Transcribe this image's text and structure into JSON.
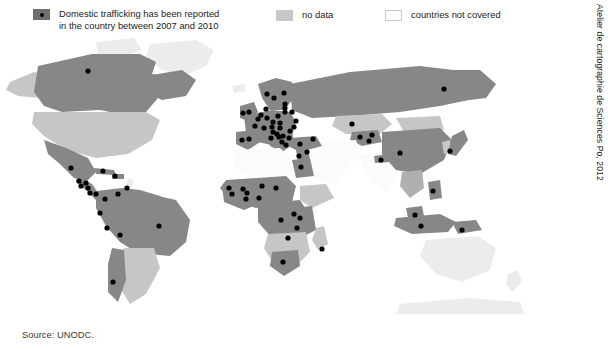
{
  "figure": {
    "source_text": "Source: UNODC.",
    "credit_text": "Atelier de cartographie de Sciences Po, 2012",
    "background": "#ffffff"
  },
  "legend": {
    "items": [
      {
        "key": "reported",
        "label": "Domestic trafficking has been reported\nin the country between 2007 and 2010",
        "swatch_type": "dotted-square",
        "swatch_color": "#6f6f6f",
        "dot_color": "#000000"
      },
      {
        "key": "no_data",
        "label": "no data",
        "swatch_type": "filled-square",
        "swatch_color": "#c7c7c7"
      },
      {
        "key": "not_covered",
        "label": "countries not covered",
        "swatch_type": "outlined-square",
        "swatch_color": "#ffffff"
      }
    ]
  },
  "map": {
    "projection": "world",
    "colors": {
      "reported": "#878787",
      "no_data": "#c6c6c6",
      "not_covered": "#fbfbfb",
      "faint": "#ececec",
      "mid": "#b0b0b0",
      "dot": "#000000",
      "border": "#ffffff"
    },
    "dot_radius": 2.6,
    "dots": [
      {
        "name": "canada",
        "x": 88,
        "y": 35
      },
      {
        "name": "mexico",
        "x": 71,
        "y": 132
      },
      {
        "name": "guatemala",
        "x": 79,
        "y": 145
      },
      {
        "name": "el-salvador",
        "x": 81,
        "y": 150
      },
      {
        "name": "honduras",
        "x": 86,
        "y": 147
      },
      {
        "name": "nicaragua",
        "x": 88,
        "y": 152
      },
      {
        "name": "costa-rica",
        "x": 90,
        "y": 157
      },
      {
        "name": "panama",
        "x": 96,
        "y": 158
      },
      {
        "name": "cuba",
        "x": 103,
        "y": 135
      },
      {
        "name": "dominican-republic",
        "x": 115,
        "y": 140
      },
      {
        "name": "trinidad",
        "x": 127,
        "y": 152
      },
      {
        "name": "colombia",
        "x": 105,
        "y": 163
      },
      {
        "name": "venezuela",
        "x": 118,
        "y": 158
      },
      {
        "name": "ecuador",
        "x": 100,
        "y": 177
      },
      {
        "name": "peru",
        "x": 107,
        "y": 192
      },
      {
        "name": "bolivia",
        "x": 120,
        "y": 199
      },
      {
        "name": "brazil",
        "x": 159,
        "y": 190
      },
      {
        "name": "chile",
        "x": 113,
        "y": 246
      },
      {
        "name": "uk",
        "x": 249,
        "y": 76
      },
      {
        "name": "ireland",
        "x": 243,
        "y": 77
      },
      {
        "name": "norway",
        "x": 267,
        "y": 58
      },
      {
        "name": "sweden",
        "x": 274,
        "y": 62
      },
      {
        "name": "finland",
        "x": 284,
        "y": 57
      },
      {
        "name": "estonia",
        "x": 285,
        "y": 68
      },
      {
        "name": "latvia",
        "x": 285,
        "y": 72
      },
      {
        "name": "lithuania",
        "x": 285,
        "y": 76
      },
      {
        "name": "belarus",
        "x": 292,
        "y": 76
      },
      {
        "name": "denmark",
        "x": 266,
        "y": 73
      },
      {
        "name": "netherlands",
        "x": 261,
        "y": 79
      },
      {
        "name": "belgium",
        "x": 258,
        "y": 83
      },
      {
        "name": "germany",
        "x": 267,
        "y": 82
      },
      {
        "name": "poland",
        "x": 278,
        "y": 80
      },
      {
        "name": "czech",
        "x": 273,
        "y": 86
      },
      {
        "name": "slovakia",
        "x": 280,
        "y": 87
      },
      {
        "name": "ukraine",
        "x": 296,
        "y": 85
      },
      {
        "name": "moldova",
        "x": 294,
        "y": 91
      },
      {
        "name": "austria",
        "x": 272,
        "y": 91
      },
      {
        "name": "hungary",
        "x": 280,
        "y": 92
      },
      {
        "name": "romania",
        "x": 290,
        "y": 95
      },
      {
        "name": "switzerland",
        "x": 264,
        "y": 92
      },
      {
        "name": "france",
        "x": 255,
        "y": 90
      },
      {
        "name": "slovenia",
        "x": 273,
        "y": 96
      },
      {
        "name": "croatia",
        "x": 277,
        "y": 98
      },
      {
        "name": "bosnia",
        "x": 279,
        "y": 101
      },
      {
        "name": "serbia",
        "x": 283,
        "y": 100
      },
      {
        "name": "bulgaria",
        "x": 289,
        "y": 102
      },
      {
        "name": "italy",
        "x": 271,
        "y": 102
      },
      {
        "name": "albania",
        "x": 282,
        "y": 106
      },
      {
        "name": "greece",
        "x": 286,
        "y": 109
      },
      {
        "name": "spain",
        "x": 249,
        "y": 103
      },
      {
        "name": "portugal",
        "x": 242,
        "y": 104
      },
      {
        "name": "turkey",
        "x": 300,
        "y": 108
      },
      {
        "name": "georgia",
        "x": 313,
        "y": 103
      },
      {
        "name": "russia-far-east",
        "x": 444,
        "y": 53
      },
      {
        "name": "kazakhstan",
        "x": 352,
        "y": 88
      },
      {
        "name": "kyrgyzstan",
        "x": 372,
        "y": 99
      },
      {
        "name": "tajikistan",
        "x": 369,
        "y": 105
      },
      {
        "name": "uzbekistan",
        "x": 360,
        "y": 101
      },
      {
        "name": "china",
        "x": 400,
        "y": 117
      },
      {
        "name": "nepal",
        "x": 381,
        "y": 124
      },
      {
        "name": "japan",
        "x": 450,
        "y": 115
      },
      {
        "name": "israel",
        "x": 299,
        "y": 120
      },
      {
        "name": "egypt",
        "x": 301,
        "y": 131
      },
      {
        "name": "syria",
        "x": 307,
        "y": 116
      },
      {
        "name": "senegal",
        "x": 229,
        "y": 152
      },
      {
        "name": "mali",
        "x": 243,
        "y": 153
      },
      {
        "name": "burkina",
        "x": 247,
        "y": 157
      },
      {
        "name": "guinea",
        "x": 232,
        "y": 158
      },
      {
        "name": "ghana",
        "x": 246,
        "y": 163
      },
      {
        "name": "nigeria",
        "x": 259,
        "y": 162
      },
      {
        "name": "niger",
        "x": 262,
        "y": 150
      },
      {
        "name": "chad",
        "x": 276,
        "y": 152
      },
      {
        "name": "drc",
        "x": 281,
        "y": 184
      },
      {
        "name": "uganda",
        "x": 294,
        "y": 178
      },
      {
        "name": "kenya",
        "x": 300,
        "y": 182
      },
      {
        "name": "tanzania",
        "x": 297,
        "y": 192
      },
      {
        "name": "zambia",
        "x": 288,
        "y": 202
      },
      {
        "name": "south-africa",
        "x": 283,
        "y": 226
      },
      {
        "name": "mauritius",
        "x": 322,
        "y": 213
      },
      {
        "name": "philippines",
        "x": 433,
        "y": 155
      },
      {
        "name": "malaysia",
        "x": 415,
        "y": 179
      },
      {
        "name": "indonesia",
        "x": 421,
        "y": 190
      },
      {
        "name": "png",
        "x": 462,
        "y": 194
      }
    ],
    "small_dots": [
      {
        "name": "minidot-1",
        "x": 319,
        "y": 294
      },
      {
        "name": "minidot-2",
        "x": 326,
        "y": 294
      }
    ]
  }
}
